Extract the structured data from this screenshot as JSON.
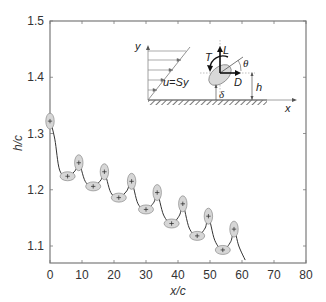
{
  "chart_data": {
    "type": "line",
    "title": "",
    "xlabel": "x/c",
    "ylabel": "h/c",
    "xlim": [
      0,
      80
    ],
    "ylim": [
      1.075,
      1.5
    ],
    "xticks": [
      0,
      10,
      20,
      30,
      40,
      50,
      60,
      70,
      80
    ],
    "xtick_labels": [
      "0",
      "10",
      "20",
      "30",
      "40",
      "50",
      "60",
      "70",
      "80"
    ],
    "yticks": [
      1.1,
      1.2,
      1.3,
      1.4,
      1.5
    ],
    "ytick_labels": [
      "1.1",
      "1.2",
      "1.3",
      "1.4",
      "1.5"
    ],
    "grid": false,
    "series": [
      {
        "name": "trajectory",
        "x": [
          0,
          1.5,
          3,
          5.5,
          8,
          9,
          11,
          13.5,
          16,
          17,
          19,
          21.5,
          24,
          25.5,
          27.5,
          30,
          32.5,
          33.5,
          35.5,
          38,
          40.5,
          41.5,
          43.5,
          46,
          48.5,
          49.5,
          51.5,
          54,
          56.5,
          57.5,
          59,
          61
        ],
        "y": [
          1.325,
          1.29,
          1.235,
          1.224,
          1.235,
          1.25,
          1.215,
          1.206,
          1.218,
          1.232,
          1.195,
          1.186,
          1.198,
          1.214,
          1.175,
          1.165,
          1.178,
          1.195,
          1.155,
          1.14,
          1.155,
          1.175,
          1.132,
          1.118,
          1.132,
          1.153,
          1.11,
          1.093,
          1.108,
          1.13,
          1.1,
          1.075
        ]
      }
    ],
    "markers": [
      {
        "x": 0,
        "y": 1.322,
        "orientation": "vertical"
      },
      {
        "x": 5.5,
        "y": 1.224,
        "orientation": "horizontal"
      },
      {
        "x": 9,
        "y": 1.248,
        "orientation": "vertical"
      },
      {
        "x": 13.5,
        "y": 1.206,
        "orientation": "horizontal"
      },
      {
        "x": 17,
        "y": 1.232,
        "orientation": "vertical"
      },
      {
        "x": 21.5,
        "y": 1.186,
        "orientation": "horizontal"
      },
      {
        "x": 25.5,
        "y": 1.215,
        "orientation": "vertical"
      },
      {
        "x": 30,
        "y": 1.165,
        "orientation": "horizontal"
      },
      {
        "x": 33.5,
        "y": 1.195,
        "orientation": "vertical"
      },
      {
        "x": 38,
        "y": 1.14,
        "orientation": "horizontal"
      },
      {
        "x": 41.5,
        "y": 1.175,
        "orientation": "vertical"
      },
      {
        "x": 46,
        "y": 1.118,
        "orientation": "horizontal"
      },
      {
        "x": 49.5,
        "y": 1.153,
        "orientation": "vertical"
      },
      {
        "x": 54,
        "y": 1.093,
        "orientation": "horizontal"
      },
      {
        "x": 57.5,
        "y": 1.13,
        "orientation": "vertical"
      }
    ],
    "inset": {
      "labels": [
        "y",
        "u=Sy",
        "L",
        "T",
        "θ",
        "D",
        "h",
        "δ",
        "x"
      ],
      "description": "Shear flow u=Sy over a wall with ellipse at height h, showing lift L, drag D, torque T, angle θ, gap δ"
    }
  },
  "axes": {
    "xlabel": "x/c",
    "ylabel": "h/c"
  },
  "inset": {
    "y_label": "y",
    "flow_label": "u=Sy",
    "lift_label": "L",
    "torque_label": "T",
    "theta_label": "θ",
    "drag_label": "D",
    "h_label": "h",
    "delta_label": "δ",
    "x_label": "x"
  },
  "colors": {
    "axis": "#7a7a7a",
    "line": "#333333",
    "ellipse_fill": "#d6d6d6",
    "ellipse_stroke": "#8a8a8a"
  }
}
